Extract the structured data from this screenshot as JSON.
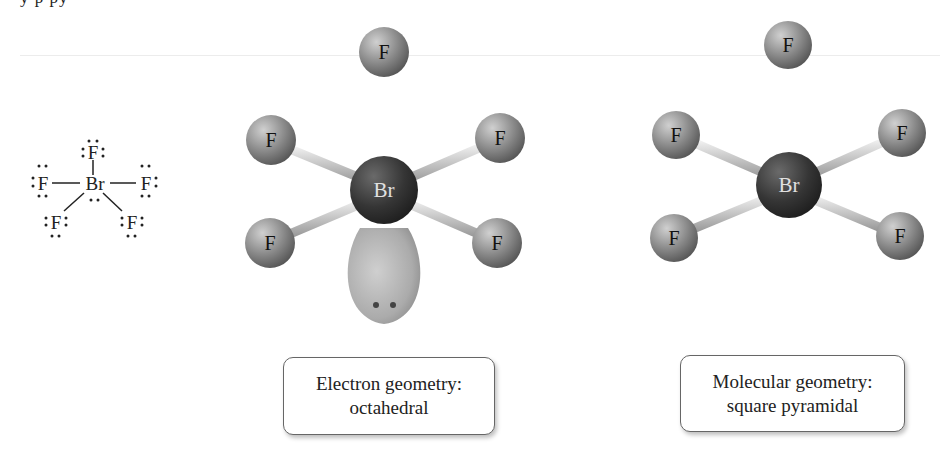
{
  "clipped_text": "y p py",
  "lewis_structure": {
    "central_atom": "Br",
    "ligands": [
      "F",
      "F",
      "F",
      "F",
      "F"
    ]
  },
  "electron_geometry_model": {
    "central_atom": "Br",
    "ligands": [
      "F",
      "F",
      "F",
      "F",
      "F"
    ],
    "lone_pair_count": 1
  },
  "molecular_geometry_model": {
    "central_atom": "Br",
    "ligands": [
      "F",
      "F",
      "F",
      "F",
      "F"
    ]
  },
  "labels": {
    "electron_geometry": {
      "line1": "Electron geometry:",
      "line2": "octahedral"
    },
    "molecular_geometry": {
      "line1": "Molecular geometry:",
      "line2": "square pyramidal"
    }
  },
  "colors": {
    "central_atom": "#3a3a3a",
    "ligand_atom": "#8a8a8a",
    "bond": "#bdbdbd",
    "lone_pair_lobe": "#b3b3b3"
  }
}
